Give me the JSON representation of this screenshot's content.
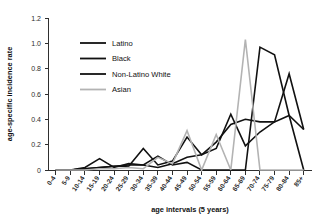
{
  "figure": {
    "title_partial": "",
    "background": "#ffffff"
  },
  "axis": {
    "y_title": "age-specific incidence rate",
    "x_title": "age intervals (5 years)",
    "y_ticks": [
      "0",
      "0.2",
      "0.4",
      "0.6",
      "0.8",
      "1.0",
      "1.2"
    ]
  },
  "legend": {
    "items": [
      {
        "label": "Latino",
        "color": "#111111"
      },
      {
        "label": "Black",
        "color": "#111111"
      },
      {
        "label": "Non-Latino White",
        "color": "#111111"
      },
      {
        "label": "Asian",
        "color": "#b3b3b3"
      }
    ]
  },
  "chart_data": {
    "type": "line",
    "title": "",
    "xlabel": "age intervals (5 years)",
    "ylabel": "age-specific incidence rate",
    "ylim": [
      0,
      1.2
    ],
    "ytick_values": [
      0,
      0.2,
      0.4,
      0.6,
      0.8,
      1.0,
      1.2
    ],
    "grid": false,
    "legend_position": "upper-left-inside",
    "categories": [
      "0-4",
      "5-9",
      "10-14",
      "15-19",
      "20-24",
      "25-29",
      "30-34",
      "35-39",
      "40-44",
      "45-49",
      "50-54",
      "55-59",
      "60-64",
      "65-69",
      "70-74",
      "75-79",
      "80-84",
      "85+"
    ],
    "series": [
      {
        "name": "Latino",
        "color": "#111111",
        "width": 1.6,
        "values": [
          0,
          0,
          0.01,
          0.02,
          0.03,
          0.04,
          0.04,
          0.02,
          0.05,
          0.1,
          0.12,
          0.17,
          0.44,
          0.19,
          0.3,
          0.38,
          0.76,
          0.32
        ]
      },
      {
        "name": "Black",
        "color": "#111111",
        "width": 1.6,
        "values": [
          0,
          0,
          0.02,
          0.09,
          0.02,
          0.05,
          0.04,
          0.11,
          0.04,
          0.06,
          0.0,
          0.0,
          0.0,
          0.0,
          0.97,
          0.91,
          0.43,
          0.0
        ]
      },
      {
        "name": "Non-Latino White",
        "color": "#111111",
        "width": 1.6,
        "values": [
          0,
          0,
          0.01,
          0.02,
          0.03,
          0.03,
          0.17,
          0.04,
          0.07,
          0.26,
          0.12,
          0.22,
          0.36,
          0.4,
          0.38,
          0.38,
          0.43,
          0.32
        ]
      },
      {
        "name": "Asian",
        "color": "#b3b3b3",
        "width": 1.6,
        "values": [
          0,
          0,
          0.0,
          0.01,
          0.01,
          0.02,
          0.01,
          0.1,
          0.05,
          0.31,
          0.0,
          0.28,
          0.0,
          1.03,
          0.0,
          0.0,
          0.0,
          0.0
        ]
      }
    ]
  }
}
